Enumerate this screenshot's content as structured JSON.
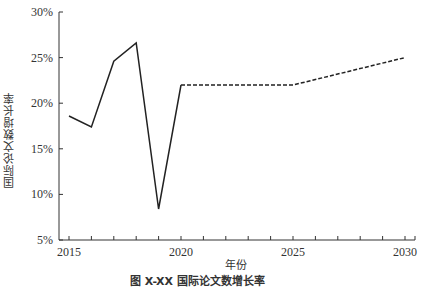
{
  "chart_data": {
    "type": "line",
    "title": "",
    "caption": "图 X-XX 国际论文数增长率",
    "xlabel": "年份",
    "ylabel": "国际论文数增长率",
    "x_ticks": [
      2015,
      2020,
      2025,
      2030
    ],
    "y_ticks": [
      "5%",
      "10%",
      "15%",
      "20%",
      "25%",
      "30%"
    ],
    "xlim": [
      2015,
      2030
    ],
    "ylim": [
      5,
      30
    ],
    "grid": false,
    "legend": null,
    "series": [
      {
        "name": "实际值",
        "style": "solid",
        "x": [
          2015,
          2016,
          2017,
          2018,
          2019,
          2020
        ],
        "values": [
          18.6,
          17.4,
          24.6,
          26.6,
          8.4,
          22.0
        ]
      },
      {
        "name": "预测值",
        "style": "dashed",
        "x": [
          2020,
          2025,
          2030
        ],
        "values": [
          22.0,
          22.0,
          25.0
        ]
      }
    ]
  }
}
